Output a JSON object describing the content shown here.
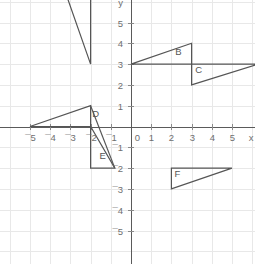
{
  "chart_data": {
    "type": "scatter",
    "title": "",
    "xlabel": "x",
    "ylabel": "y",
    "grid": true,
    "legend": "none",
    "xlim": [
      -5.9,
      6.2
    ],
    "ylim": [
      -6.4,
      6.4
    ],
    "x_ticks": [
      -5,
      -4,
      -3,
      -2,
      -1,
      0,
      1,
      2,
      3,
      4,
      5
    ],
    "x_tick_labels": [
      "¯5",
      "¯4",
      "¯3",
      "¯2",
      "¯1",
      "0",
      "1",
      "2",
      "3",
      "4",
      "5"
    ],
    "y_ticks": [
      -5,
      -4,
      -3,
      -2,
      -1,
      1,
      2,
      3,
      4,
      5
    ],
    "y_tick_labels": [
      "¯5",
      "¯4",
      "¯3",
      "¯2",
      "¯1",
      "1",
      "2",
      "3",
      "4",
      "5"
    ],
    "origin_label": "0",
    "axis_end_labels": {
      "x": "x",
      "y": "y"
    },
    "shapes": [
      {
        "name": "A",
        "label": "A",
        "label_point": [
          -1.55,
          6.25
        ],
        "points": [
          [
            -2,
            3
          ],
          [
            -2,
            7.2
          ],
          [
            -3.3,
            6.6
          ]
        ],
        "closed": true
      },
      {
        "name": "B",
        "label": "B",
        "label_point": [
          2.35,
          3.45
        ],
        "points": [
          [
            0,
            3
          ],
          [
            3,
            4
          ],
          [
            3,
            3
          ]
        ],
        "closed": true
      },
      {
        "name": "C",
        "label": "C",
        "label_point": [
          3.35,
          2.55
        ],
        "points": [
          [
            3,
            3
          ],
          [
            3,
            2
          ],
          [
            6.3,
            3
          ]
        ],
        "closed": true
      },
      {
        "name": "D",
        "label": "D",
        "label_point": [
          -1.75,
          0.45
        ],
        "points": [
          [
            -5,
            0
          ],
          [
            -2,
            1
          ],
          [
            -2,
            0
          ]
        ],
        "closed": true
      },
      {
        "name": "E",
        "label": "E",
        "label_point": [
          -1.4,
          -1.55
        ],
        "points": [
          [
            -2,
            0
          ],
          [
            -2,
            -2
          ],
          [
            -0.8,
            -2
          ]
        ],
        "closed": true,
        "extra_segments": [
          [
            [
              -2,
              1
            ],
            [
              -0.8,
              -2
            ]
          ]
        ]
      },
      {
        "name": "F",
        "label": "F",
        "label_point": [
          2.3,
          -2.45
        ],
        "points": [
          [
            2,
            -2
          ],
          [
            2,
            -3
          ],
          [
            5,
            -2
          ]
        ],
        "closed": true
      }
    ]
  },
  "colors": {
    "grid": "#e8e8e8",
    "axis": "#5a5a5a",
    "tick_text": "#6f6f6f",
    "shape_stroke": "#555555",
    "background": "#ffffff"
  }
}
